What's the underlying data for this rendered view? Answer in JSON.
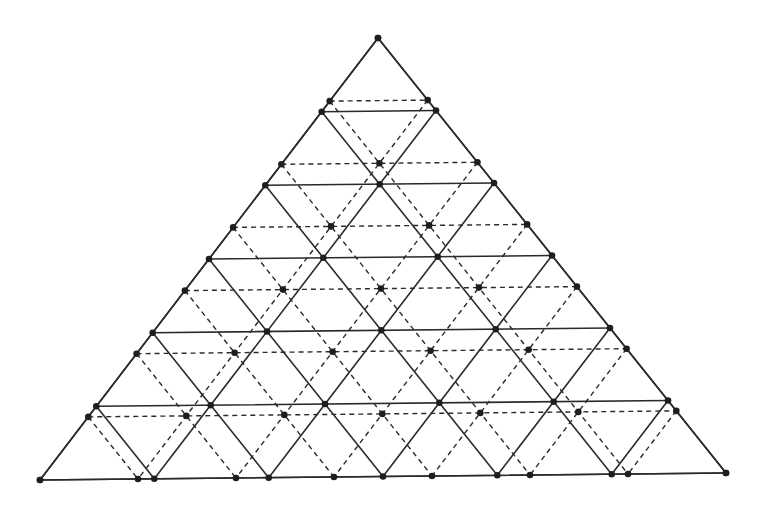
{
  "diagram": {
    "type": "overlaid-triangular-lattices",
    "canvas": {
      "width": 763,
      "height": 509,
      "background": "#ffffff"
    },
    "triangle": {
      "apex": [
        378,
        38
      ],
      "bottom_left": [
        40,
        480
      ],
      "bottom_right": [
        726,
        473
      ]
    },
    "lattices": [
      {
        "name": "solid-grid",
        "divisions": 6,
        "style": "solid",
        "color": "#2a2a2a",
        "show_vertices": true
      },
      {
        "name": "dashed-grid",
        "divisions": 7,
        "style": "dashed",
        "color": "#2a2a2a",
        "show_vertices": true
      }
    ],
    "vertex_color": "#1e1e1e",
    "vertex_radius": 3.3
  }
}
